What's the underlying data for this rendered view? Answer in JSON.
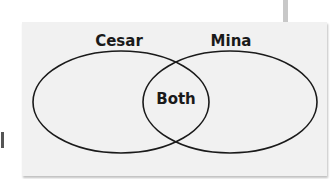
{
  "diagram": {
    "type": "venn",
    "sets": [
      {
        "label": "Cesar"
      },
      {
        "label": "Mina"
      }
    ],
    "intersection_label": "Both",
    "colors": {
      "stroke": "#1a1a1a",
      "background": "#f1f1f1"
    }
  }
}
